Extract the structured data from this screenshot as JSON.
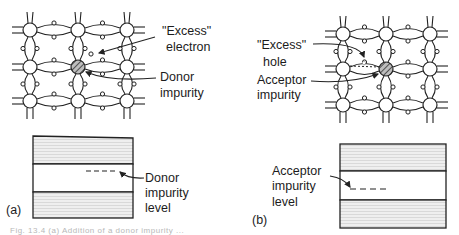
{
  "panel_a": {
    "tag": "(a)",
    "excess_label_line1": "\"Excess\"",
    "excess_label_line2": "electron",
    "impurity_label_line1": "Donor",
    "impurity_label_line2": "impurity",
    "level_label_line1": "Donor",
    "level_label_line2": "impurity",
    "level_label_line3": "level"
  },
  "panel_b": {
    "tag": "(b)",
    "excess_label_line1": "\"Excess\"",
    "excess_label_line2": "hole",
    "impurity_label_line1": "Acceptor",
    "impurity_label_line2": "impurity",
    "level_label_line1": "Acceptor",
    "level_label_line2": "impurity",
    "level_label_line3": "level"
  },
  "caption": "Fig. 13.4 (a) Addition of a donor impurity ..."
}
